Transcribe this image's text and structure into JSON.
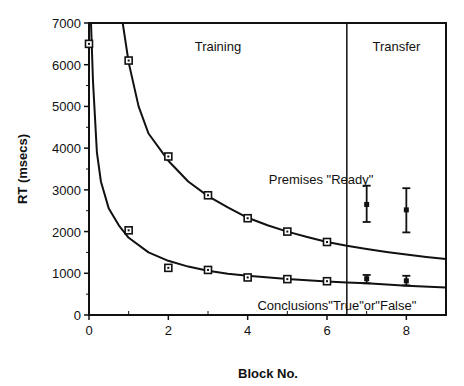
{
  "chart_data": {
    "type": "scatter",
    "title": "",
    "xlabel": "Block No.",
    "ylabel": "RT   (msecs)",
    "xlim": [
      0,
      9
    ],
    "ylim": [
      0,
      7000
    ],
    "xticks": [
      0,
      2,
      4,
      6,
      8
    ],
    "xminor_ticks": [
      1,
      3,
      5,
      7,
      9
    ],
    "yticks": [
      0,
      1000,
      2000,
      3000,
      4000,
      5000,
      6000,
      7000
    ],
    "grid": false,
    "legend": null,
    "divider_x": 6.5,
    "regions": [
      {
        "label": "Training",
        "x_center": 3.25
      },
      {
        "label": "Transfer",
        "x_center": 7.75
      }
    ],
    "annotations": [
      {
        "text": "Premises \"Ready\"",
        "x": 5.85,
        "y": 3250
      },
      {
        "text": "Conclusions\"True\"or\"False\"",
        "x": 6.25,
        "y": 250
      }
    ],
    "series": [
      {
        "name": "Premises \"Ready\"",
        "phase": "training",
        "marker": "square",
        "x": [
          1,
          2,
          3,
          4,
          5,
          6
        ],
        "y": [
          6100,
          3800,
          2870,
          2320,
          2000,
          1750
        ]
      },
      {
        "name": "Conclusions \"True\" or \"False\"",
        "phase": "training",
        "marker": "square",
        "x": [
          0,
          1,
          2,
          3,
          4,
          5,
          6
        ],
        "y": [
          6500,
          2030,
          1130,
          1080,
          900,
          860,
          810
        ]
      },
      {
        "name": "Premises \"Ready\" (transfer)",
        "phase": "transfer",
        "marker": "dot-errorbar",
        "x": [
          7,
          8
        ],
        "y": [
          2650,
          2520
        ],
        "err_low": [
          2230,
          1980
        ],
        "err_high": [
          3100,
          3040
        ]
      },
      {
        "name": "Conclusions \"True\" or \"False\" (transfer)",
        "phase": "transfer",
        "marker": "dot-errorbar",
        "x": [
          7,
          8
        ],
        "y": [
          870,
          820
        ],
        "err_low": [
          760,
          710
        ],
        "err_high": [
          960,
          940
        ]
      }
    ],
    "fitted_curves": [
      {
        "name": "Premises power-law fit",
        "x": [
          0.85,
          1,
          1.25,
          1.5,
          2,
          2.5,
          3,
          3.5,
          4,
          4.5,
          5,
          5.5,
          6,
          6.5,
          7,
          7.5,
          8,
          8.5,
          9
        ],
        "y": [
          7000,
          6050,
          5000,
          4350,
          3700,
          3200,
          2850,
          2580,
          2330,
          2150,
          2000,
          1870,
          1750,
          1660,
          1580,
          1510,
          1450,
          1390,
          1340
        ]
      },
      {
        "name": "Conclusions power-law fit",
        "x": [
          0.05,
          0.1,
          0.2,
          0.3,
          0.5,
          0.75,
          1,
          1.5,
          2,
          2.5,
          3,
          3.5,
          4,
          5,
          6,
          6.5,
          7,
          8,
          9
        ],
        "y": [
          7000,
          5600,
          3900,
          3200,
          2550,
          2150,
          1850,
          1500,
          1300,
          1160,
          1060,
          990,
          940,
          860,
          800,
          780,
          760,
          700,
          660
        ]
      }
    ]
  }
}
